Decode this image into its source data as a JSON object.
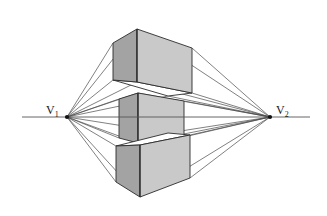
{
  "figure": {
    "background_color": "#ffffff",
    "width": 327,
    "height": 216
  },
  "horizon": {
    "name": "horizon-line",
    "y": 117,
    "x_start": 22,
    "x_end": 310,
    "color": "#555555"
  },
  "vanishing_points": [
    {
      "id": "v1",
      "label": "V",
      "subscript": "1",
      "x": 67,
      "y": 117,
      "label_x": 48,
      "label_y": 113,
      "side": "left"
    },
    {
      "id": "v2",
      "label": "V",
      "subscript": "2",
      "x": 270,
      "y": 117,
      "label_x": 276,
      "label_y": 113,
      "side": "right"
    }
  ],
  "colors": {
    "left_face": "#a3a3a3",
    "right_face": "#c9c9c9",
    "top_face": "#d8d8d8",
    "outline": "#2b2b2b",
    "construction_line": "#4a4a4a",
    "horizon": "#555555"
  },
  "cubes": [
    {
      "id": "cube-above-horizon",
      "name": "top-cube",
      "position": "above horizon",
      "view": "seen from below (underside hidden, front vertical edge nearest)",
      "front_edge_x": 137,
      "front_edge_top_y": 29,
      "front_edge_bottom_y": 82,
      "left_back_x": 113,
      "right_back_x": 192,
      "left_face": {
        "points": "113,43 137,29 137,82 113,80"
      },
      "right_face": {
        "points": "137,29 192,48 192,93 137,82"
      },
      "bottom_face": {
        "points": "113,80 137,82 192,93 168,96"
      }
    },
    {
      "id": "cube-on-horizon",
      "name": "middle-cube",
      "position": "straddling horizon",
      "view": "eye level, only two vertical faces visible",
      "front_edge_x": 138,
      "front_edge_top_y": 93,
      "front_edge_bottom_y": 143,
      "left_back_x": 119,
      "right_back_x": 184,
      "left_face": {
        "points": "119,99 138,93 138,143 119,138"
      },
      "right_face": {
        "points": "138,93 184,101 184,137 138,143"
      }
    },
    {
      "id": "cube-below-horizon",
      "name": "bottom-cube",
      "position": "below horizon",
      "view": "seen from above (top face visible)",
      "front_edge_x": 140,
      "front_edge_top_y": 145,
      "front_edge_bottom_y": 197,
      "left_back_x": 116,
      "right_back_x": 190,
      "top_face": {
        "points": "116,146 140,145 190,135 168,133"
      },
      "left_face": {
        "points": "116,146 140,145 140,197 116,182"
      },
      "right_face": {
        "points": "140,145 190,135 190,178 140,197"
      }
    }
  ],
  "construction_lines": {
    "name": "perspective-rays",
    "description": "Straight lines drawn from each vanishing point to every corner of the three cubes",
    "from_v1_count": 9,
    "from_v2_count": 9
  },
  "legend": {
    "visible": false
  }
}
